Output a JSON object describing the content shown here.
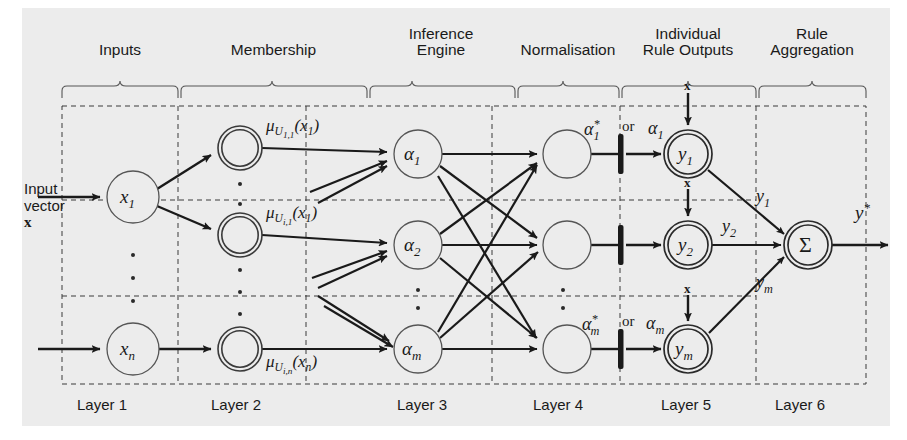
{
  "figure": {
    "type": "diagram",
    "background_color": "#ececec",
    "line_color": "#1a1a1a"
  },
  "sections": [
    {
      "id": "inputs",
      "label": "Inputs",
      "x": 105,
      "y": 24,
      "brace_x0": 62,
      "brace_x1": 178
    },
    {
      "id": "membership",
      "label": "Membership",
      "x": 252,
      "y": 24,
      "brace_x0": 180,
      "brace_x1": 367
    },
    {
      "id": "inference-engine",
      "label": "Inference\nEngine",
      "line1": "Inference",
      "line2": "Engine",
      "x": 410,
      "y": 14,
      "brace_x0": 369,
      "brace_x1": 515
    },
    {
      "id": "normalisation",
      "label": "Normalisation",
      "x": 558,
      "y": 24,
      "brace_x0": 517,
      "brace_x1": 619
    },
    {
      "id": "individual-rule-outputs",
      "line1": "Individual",
      "line2": "Rule Outputs",
      "x": 688,
      "y": 14,
      "brace_x0": 621,
      "brace_x1": 756
    },
    {
      "id": "rule-aggregation",
      "line1": "Rule",
      "line2": "Aggregation",
      "x": 812,
      "y": 14,
      "brace_x0": 758,
      "brace_x1": 866
    }
  ],
  "layers": [
    {
      "id": "layer-1",
      "label": "Layer 1",
      "x": 101,
      "y": 404
    },
    {
      "id": "layer-2",
      "label": "Layer 2",
      "x": 236,
      "y": 404
    },
    {
      "id": "layer-3",
      "label": "Layer 3",
      "x": 422,
      "y": 404
    },
    {
      "id": "layer-4",
      "label": "Layer 4",
      "x": 558,
      "y": 404
    },
    {
      "id": "layer-5",
      "label": "Layer 5",
      "x": 686,
      "y": 404
    },
    {
      "id": "layer-6",
      "label": "Layer 6",
      "x": 800,
      "y": 404
    }
  ],
  "input_vector": {
    "line1": "Input",
    "line2": "vector",
    "line3": "x",
    "x": 25,
    "y": 188
  },
  "nodes": {
    "layer1": [
      {
        "id": "node-x1",
        "label_base": "x",
        "label_sub": "1",
        "cx": 133,
        "cy": 197,
        "r": 26,
        "style": "single"
      },
      {
        "id": "node-xn",
        "label_base": "x",
        "label_sub": "n",
        "cx": 133,
        "cy": 349,
        "r": 26,
        "style": "single"
      }
    ],
    "layer2": [
      {
        "id": "node-mf-1",
        "cx": 240,
        "cy": 148,
        "r": 22,
        "style": "double"
      },
      {
        "id": "node-mf-2",
        "cx": 240,
        "cy": 235,
        "r": 22,
        "style": "double"
      },
      {
        "id": "node-mf-3",
        "cx": 240,
        "cy": 349,
        "r": 22,
        "style": "double"
      }
    ],
    "layer3": [
      {
        "id": "node-alpha1",
        "label_base": "α",
        "label_sub": "1",
        "cx": 418,
        "cy": 154,
        "r": 24,
        "style": "single"
      },
      {
        "id": "node-alpha2",
        "label_base": "α",
        "label_sub": "2",
        "cx": 418,
        "cy": 245,
        "r": 24,
        "style": "single"
      },
      {
        "id": "node-alpham",
        "label_base": "α",
        "label_sub": "m",
        "cx": 418,
        "cy": 349,
        "r": 24,
        "style": "single"
      }
    ],
    "layer4": [
      {
        "id": "node-norm-1",
        "cx": 567,
        "cy": 154,
        "r": 24,
        "style": "single"
      },
      {
        "id": "node-norm-2",
        "cx": 567,
        "cy": 245,
        "r": 24,
        "style": "single"
      },
      {
        "id": "node-norm-m",
        "cx": 567,
        "cy": 349,
        "r": 24,
        "style": "single"
      }
    ],
    "layer5": [
      {
        "id": "node-y1",
        "label_base": "y",
        "label_sub": "1",
        "cx": 688,
        "cy": 154,
        "r": 24,
        "style": "double"
      },
      {
        "id": "node-y2",
        "label_base": "y",
        "label_sub": "2",
        "cx": 688,
        "cy": 245,
        "r": 24,
        "style": "double"
      },
      {
        "id": "node-ym",
        "label_base": "y",
        "label_sub": "m",
        "cx": 688,
        "cy": 349,
        "r": 24,
        "style": "double"
      }
    ],
    "layer6": [
      {
        "id": "node-sigma",
        "label_base": "Σ",
        "cx": 808,
        "cy": 245,
        "r": 24,
        "style": "double"
      }
    ]
  },
  "edge_labels": {
    "membership": [
      {
        "id": "mu-U-1-1",
        "mu": "μ",
        "sub": "U",
        "subsub": "1,1",
        "arg": "(x",
        "argsub": "1",
        "argclose": ")",
        "x": 268,
        "y": 126
      },
      {
        "id": "mu-U-i-1",
        "mu": "μ",
        "sub": "U",
        "subsub": "i,1",
        "arg": "(x",
        "argsub": "1",
        "argclose": ")",
        "x": 268,
        "y": 213
      },
      {
        "id": "mu-U-i-n",
        "mu": "μ",
        "sub": "U",
        "subsub": "i,n",
        "arg": "(x",
        "argsub": "n",
        "argclose": ")",
        "x": 268,
        "y": 355
      }
    ],
    "normalised": [
      {
        "id": "alpha-star-1",
        "base": "α",
        "sup": "*",
        "sub": "1",
        "x": 588,
        "y": 122
      },
      {
        "id": "alpha-star-m",
        "base": "α",
        "sup": "*",
        "sub": "m",
        "x": 588,
        "y": 317
      }
    ],
    "or_labels": [
      {
        "id": "or-top",
        "text": "or",
        "x": 626,
        "y": 123
      },
      {
        "id": "or-bottom",
        "text": "or",
        "x": 626,
        "y": 318
      }
    ],
    "alpha_out": [
      {
        "id": "alpha-out-1",
        "base": "α",
        "sub": "1",
        "x": 650,
        "y": 123
      },
      {
        "id": "alpha-out-m",
        "base": "α",
        "sub": "m",
        "x": 650,
        "y": 318
      }
    ],
    "crisp_inputs": [
      {
        "id": "crisp-x-1",
        "text": "x",
        "x": 685,
        "y": 86
      },
      {
        "id": "crisp-x-2",
        "text": "x",
        "x": 685,
        "y": 182
      },
      {
        "id": "crisp-x-m",
        "text": "x",
        "x": 685,
        "y": 288
      }
    ],
    "rule_outputs": [
      {
        "id": "y-out-1",
        "base": "y",
        "sub": "1",
        "x": 758,
        "y": 196
      },
      {
        "id": "y-out-2",
        "base": "y",
        "sub": "2",
        "x": 758,
        "y": 222
      },
      {
        "id": "y-out-m",
        "base": "y",
        "sub": "m",
        "x": 758,
        "y": 285
      }
    ],
    "final_output": {
      "id": "y-star",
      "base": "y",
      "sup": "*",
      "x": 858,
      "y": 208
    }
  },
  "dot_columns": [
    {
      "id": "dots-layer1",
      "x": 133,
      "ys": [
        255,
        278,
        301
      ]
    },
    {
      "id": "dots-layer2-a",
      "x": 240,
      "ys": [
        184,
        203
      ]
    },
    {
      "id": "dots-layer2-b",
      "x": 240,
      "ys": [
        268,
        290,
        312
      ]
    },
    {
      "id": "dots-layer3",
      "x": 418,
      "ys": [
        288,
        305
      ]
    },
    {
      "id": "dots-layer4",
      "x": 567,
      "ys": [
        288,
        305
      ]
    }
  ]
}
